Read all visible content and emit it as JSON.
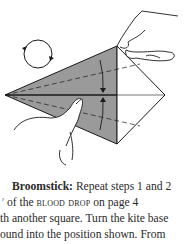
{
  "figure": {
    "rotation_symbol": "rotate-arrows-icon",
    "paper_color": "#9a9a9a",
    "line_color": "#1a1a1a"
  },
  "instructions": {
    "title": "Broomstick:",
    "line1_rest": " Repeat steps 1 and 2",
    "line2_prefix": "of the ",
    "line2_smallcaps": "blood drop",
    "line2_suffix": " on page 4",
    "line3": "th another square. Turn the kite base",
    "line4": "ound into the position shown. From"
  }
}
